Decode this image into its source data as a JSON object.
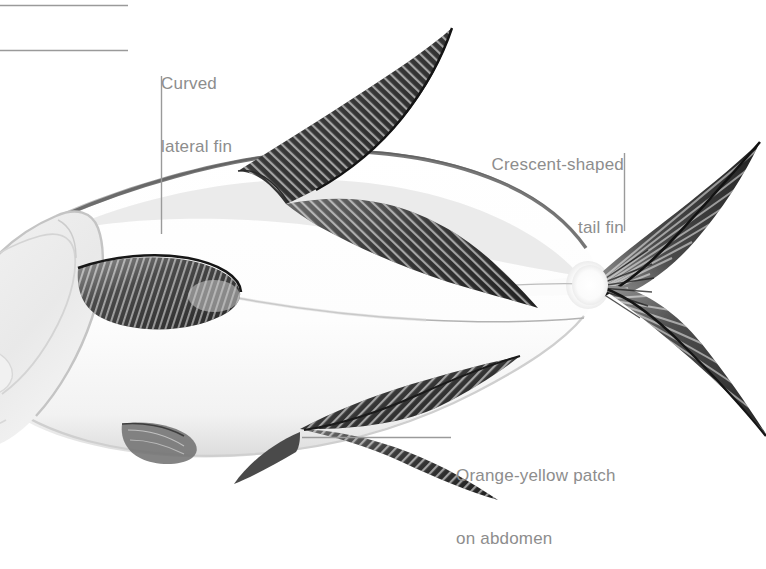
{
  "illustration": {
    "subject": "pompano-fish-lateral-view",
    "background_color": "#ffffff",
    "line_color": "#9a9a9a",
    "text_color": "#8d8d8d",
    "body_light": "#f4f4f4",
    "body_mid": "#c9c9c9",
    "body_dark": "#6f6f6f",
    "fin_dark": "#3a3a3a",
    "fin_darkest": "#1d1d1d"
  },
  "callouts": [
    {
      "id": "curved-lateral-fin",
      "label": "Curved\nlateral fin",
      "line1": "Curved",
      "line2": "lateral fin",
      "align": "left",
      "leader": {
        "type": "vertical",
        "x": 161,
        "y1": 76,
        "y2": 234
      }
    },
    {
      "id": "crescent-shaped-tail-fin",
      "label": "Crescent-shaped\ntail fin",
      "line1": "Crescent-shaped",
      "line2": "tail fin",
      "align": "right",
      "leader": {
        "type": "vertical",
        "x": 624,
        "y1": 153,
        "y2": 231
      }
    },
    {
      "id": "orange-yellow-patch-on-abdomen",
      "label": "Orange-yellow patch\non abdomen",
      "line1": "Orange-yellow patch",
      "line2": "on abdomen",
      "align": "left",
      "leader": {
        "type": "horizontal",
        "y": 437,
        "x1": 302,
        "x2": 451
      }
    }
  ],
  "cropped_leaders": [
    {
      "id": "top-leader-1",
      "y": 5,
      "x1": 0,
      "x2": 128
    },
    {
      "id": "top-leader-2",
      "y": 50,
      "x1": 0,
      "x2": 128
    }
  ]
}
